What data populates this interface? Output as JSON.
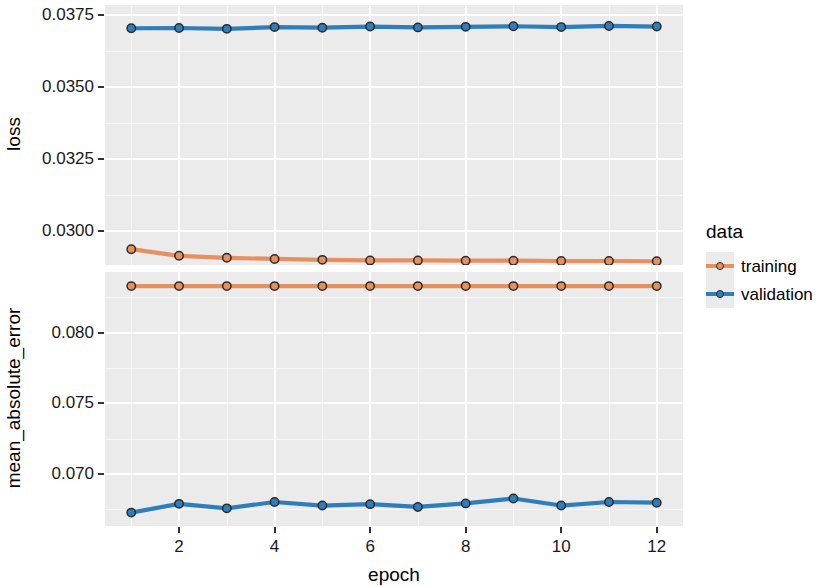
{
  "chart_data": {
    "type": "line",
    "title": "",
    "subtitle": "",
    "xlabel": "epoch",
    "facets": [
      {
        "name": "loss",
        "ylabel": "loss",
        "ylim": [
          0.0288,
          0.03785
        ],
        "yticks": [
          0.03,
          0.0325,
          0.035,
          0.0375
        ],
        "ytick_labels": [
          "0.0300",
          "0.0325",
          "0.0350",
          "0.0375"
        ],
        "series": [
          {
            "name": "training",
            "color": "#E69060",
            "x": [
              1,
              2,
              3,
              4,
              5,
              6,
              7,
              8,
              9,
              10,
              11,
              12
            ],
            "values": [
              0.02935,
              0.02912,
              0.02905,
              0.02901,
              0.02898,
              0.02896,
              0.02896,
              0.02895,
              0.02895,
              0.02894,
              0.02894,
              0.02893
            ]
          },
          {
            "name": "validation",
            "color": "#2E7EBB",
            "x": [
              1,
              2,
              3,
              4,
              5,
              6,
              7,
              8,
              9,
              10,
              11,
              12
            ],
            "values": [
              0.03704,
              0.03705,
              0.03702,
              0.03708,
              0.03706,
              0.0371,
              0.03707,
              0.03709,
              0.03711,
              0.03708,
              0.03712,
              0.0371
            ]
          }
        ]
      },
      {
        "name": "mean_absolute_error",
        "ylabel": "mean_absolute_error",
        "ylim": [
          0.0663,
          0.0843
        ],
        "yticks": [
          0.07,
          0.075,
          0.08
        ],
        "ytick_labels": [
          "0.070",
          "0.075",
          "0.080"
        ],
        "series": [
          {
            "name": "training",
            "color": "#E69060",
            "x": [
              1,
              2,
              3,
              4,
              5,
              6,
              7,
              8,
              9,
              10,
              11,
              12
            ],
            "values": [
              0.0833,
              0.0833,
              0.0833,
              0.0833,
              0.0833,
              0.0833,
              0.0833,
              0.0833,
              0.0833,
              0.0833,
              0.0833,
              0.0833
            ]
          },
          {
            "name": "validation",
            "color": "#2E7EBB",
            "x": [
              1,
              2,
              3,
              4,
              5,
              6,
              7,
              8,
              9,
              10,
              11,
              12
            ],
            "values": [
              0.06725,
              0.06787,
              0.06755,
              0.068,
              0.06775,
              0.06785,
              0.06765,
              0.0679,
              0.06825,
              0.06775,
              0.068,
              0.06795
            ]
          }
        ]
      }
    ],
    "xlim": [
      0.45,
      12.55
    ],
    "xticks": [
      2,
      4,
      6,
      8,
      10,
      12
    ],
    "xtick_labels": [
      "2",
      "4",
      "6",
      "8",
      "10",
      "12"
    ],
    "grid": true,
    "legend": {
      "title": "data",
      "position": "right",
      "entries": [
        {
          "label": "training",
          "color": "#E69060"
        },
        {
          "label": "validation",
          "color": "#2E7EBB"
        }
      ]
    },
    "panel_background": "#EBEBEB",
    "gridline_color": "#FFFFFF",
    "point_outline_color": "#2B2B2B"
  }
}
